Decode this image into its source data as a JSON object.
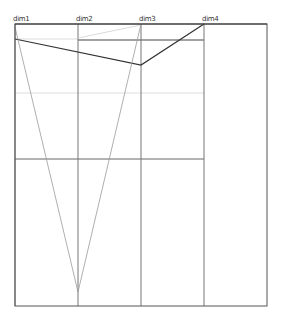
{
  "chart_data": {
    "type": "parallel_coordinates",
    "title": "",
    "dimensions": [
      "dim1",
      "dim2",
      "dim3",
      "dim4"
    ],
    "axes_x": [
      15,
      78,
      141,
      204
    ],
    "plot_area": {
      "left": 15,
      "top": 24,
      "right": 267,
      "bottom": 306
    },
    "gridlines": [
      {
        "y": 40,
        "x1": 78,
        "x2": 204,
        "color": "#444444",
        "width": 1
      },
      {
        "y": 39,
        "x1": 15,
        "x2": 78,
        "color": "#dddddd",
        "width": 1
      },
      {
        "y": 93,
        "x1": 15,
        "x2": 204,
        "color": "#dddddd",
        "width": 1
      },
      {
        "y": 159,
        "x1": 15,
        "x2": 204,
        "color": "#666666",
        "width": 1
      }
    ],
    "series": [
      {
        "name": "line-1",
        "color": "#333333",
        "width": 1.2,
        "points_y": [
          39,
          null,
          65,
          24
        ],
        "path": [
          [
            15,
            39
          ],
          [
            141,
            65
          ],
          [
            204,
            24
          ]
        ]
      },
      {
        "name": "line-2",
        "color": "#9a9a9a",
        "width": 0.8,
        "points_y": [
          27,
          292,
          24,
          null
        ],
        "path": [
          [
            15,
            27
          ],
          [
            78,
            292
          ],
          [
            141,
            24
          ]
        ]
      },
      {
        "name": "line-3",
        "color": "#d0d0d0",
        "width": 0.8,
        "points_y": [
          null,
          38,
          25,
          null
        ],
        "path": [
          [
            78,
            38
          ],
          [
            141,
            25
          ]
        ]
      }
    ],
    "grid": true,
    "legend": null
  },
  "labels": {
    "dim1": "dim1",
    "dim2": "dim2",
    "dim3": "dim3",
    "dim4": "dim4"
  }
}
